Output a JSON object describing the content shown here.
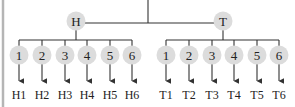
{
  "colors": {
    "node_fill": "#dcdcdc",
    "line": "#333333",
    "text": "#222222",
    "border": "#b5b5b5"
  },
  "root": {
    "branches": [
      {
        "label": "H",
        "children": [
          {
            "label": "1",
            "outcome": "H1"
          },
          {
            "label": "2",
            "outcome": "H2"
          },
          {
            "label": "3",
            "outcome": "H3"
          },
          {
            "label": "4",
            "outcome": "H4"
          },
          {
            "label": "5",
            "outcome": "H5"
          },
          {
            "label": "6",
            "outcome": "H6"
          }
        ]
      },
      {
        "label": "T",
        "children": [
          {
            "label": "1",
            "outcome": "T1"
          },
          {
            "label": "2",
            "outcome": "T2"
          },
          {
            "label": "3",
            "outcome": "T3"
          },
          {
            "label": "4",
            "outcome": "T4"
          },
          {
            "label": "5",
            "outcome": "T5"
          },
          {
            "label": "6",
            "outcome": "T6"
          }
        ]
      }
    ]
  }
}
